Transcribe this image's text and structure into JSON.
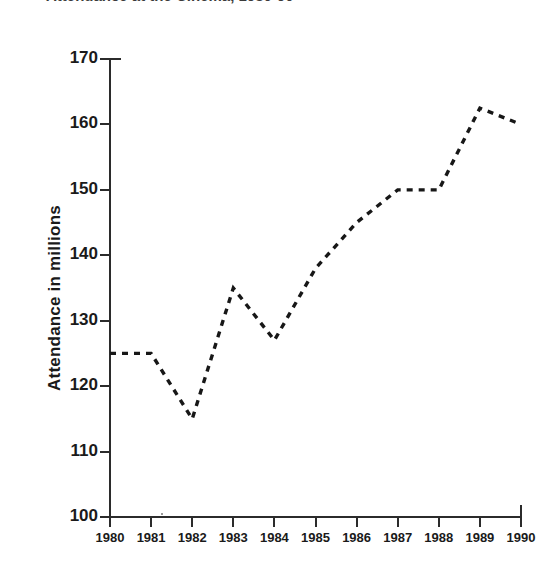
{
  "chart_data": {
    "type": "line",
    "title": "Attendance at the Cinema, 1980-90",
    "title_visible_fragment": "Attendance at the Cinema, 1980-90",
    "xlabel": "",
    "ylabel": "Attendance in millions",
    "categories": [
      "1980",
      "1981",
      "1982",
      "1983",
      "1984",
      "1985",
      "1986",
      "1987",
      "1988",
      "1989",
      "1990"
    ],
    "x": [
      1980,
      1981,
      1982,
      1983,
      1984,
      1985,
      1986,
      1987,
      1988,
      1989,
      1990
    ],
    "values": [
      125,
      125,
      115,
      135,
      127,
      138,
      145,
      150,
      150,
      162.5,
      160
    ],
    "series": [
      {
        "name": "Attendance",
        "values": [
          125,
          125,
          115,
          135,
          127,
          138,
          145,
          150,
          150,
          162.5,
          160
        ],
        "line_style": "dashed",
        "color": "#171717",
        "markers": "none"
      }
    ],
    "ylim": [
      100,
      170
    ],
    "xlim": [
      1980,
      1990
    ],
    "ytick_labels": [
      "100",
      "110",
      "120",
      "130",
      "140",
      "150",
      "160",
      "170"
    ],
    "ytick_values": [
      100,
      110,
      120,
      130,
      140,
      150,
      160,
      170
    ],
    "xtick_labels": [
      "1980",
      "1981",
      "1982",
      "1983",
      "1984",
      "1985",
      "1986",
      "1987",
      "1988",
      "1989",
      "1990"
    ],
    "grid": false,
    "legend": false,
    "legend_position": "none",
    "background_color": "#ffffff",
    "axis_color": "#2b2b2b"
  },
  "axis": {
    "y_title": "Attendance in millions",
    "y_ticks": [
      {
        "label": "170",
        "value": 170
      },
      {
        "label": "160",
        "value": 160
      },
      {
        "label": "150",
        "value": 150
      },
      {
        "label": "140",
        "value": 140
      },
      {
        "label": "130",
        "value": 130
      },
      {
        "label": "120",
        "value": 120
      },
      {
        "label": "110",
        "value": 110
      },
      {
        "label": "100",
        "value": 100
      }
    ],
    "x_ticks": [
      {
        "label": "1980"
      },
      {
        "label": "1981"
      },
      {
        "label": "1982"
      },
      {
        "label": "1983"
      },
      {
        "label": "1984"
      },
      {
        "label": "1985"
      },
      {
        "label": "1986"
      },
      {
        "label": "1987"
      },
      {
        "label": "1988"
      },
      {
        "label": "1989"
      },
      {
        "label": "1990"
      }
    ]
  }
}
